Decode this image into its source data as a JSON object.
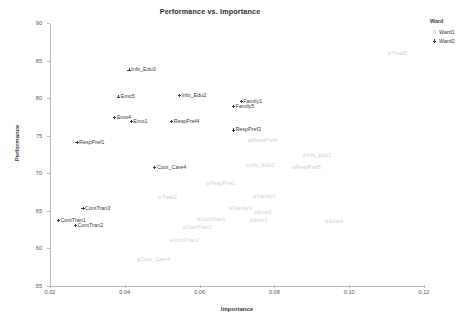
{
  "chart_data": {
    "type": "scatter",
    "title": "Performance vs. Importance",
    "xlabel": "Importance",
    "ylabel": "Performance",
    "xlim": [
      0.02,
      0.12
    ],
    "ylim": [
      55,
      90
    ],
    "xticks": [
      "0.02",
      "0.04",
      "0.06",
      "0.08",
      "0.10",
      "0.12"
    ],
    "xtick_values": [
      0.02,
      0.04,
      0.06,
      0.08,
      0.1,
      0.12
    ],
    "yticks": [
      "90",
      "85",
      "80",
      "75",
      "70",
      "65",
      "60",
      "55"
    ],
    "ytick_values": [
      90,
      85,
      80,
      75,
      70,
      65,
      60,
      55
    ],
    "grid": false,
    "legend": {
      "title": "Ward",
      "position": "right",
      "entries": [
        {
          "label": "Ward1",
          "marker": "circle-marker",
          "color": "#cfcfcf"
        },
        {
          "label": "Ward2",
          "marker": "plus-marker",
          "color": "#3a3a3a"
        }
      ]
    },
    "series": [
      {
        "name": "Ward2",
        "marker": "plus-marker",
        "color": "#3a3a3a",
        "points": [
          {
            "label": "Info_Edu3",
            "x": 0.0411,
            "y": 83.9
          },
          {
            "label": "Emo5",
            "x": 0.0383,
            "y": 80.3
          },
          {
            "label": "Emo4",
            "x": 0.0373,
            "y": 77.6
          },
          {
            "label": "Emo1",
            "x": 0.0417,
            "y": 77.0
          },
          {
            "label": "Info_Edu2",
            "x": 0.0546,
            "y": 80.5
          },
          {
            "label": "Family1",
            "x": 0.0711,
            "y": 79.7
          },
          {
            "label": "Family5",
            "x": 0.069,
            "y": 79.0
          },
          {
            "label": "RespPref4",
            "x": 0.0525,
            "y": 77.0
          },
          {
            "label": "RespPref3",
            "x": 0.069,
            "y": 75.9
          },
          {
            "label": "RespPref1",
            "x": 0.0272,
            "y": 74.2
          },
          {
            "label": "Coor_Care4",
            "x": 0.048,
            "y": 70.9
          },
          {
            "label": "ContTran3",
            "x": 0.0288,
            "y": 65.5
          },
          {
            "label": "ContTran1",
            "x": 0.0222,
            "y": 63.9
          },
          {
            "label": "ContTran2",
            "x": 0.0268,
            "y": 63.2
          }
        ]
      },
      {
        "name": "Ward1",
        "marker": "circle-marker",
        "color": "#cfcfcf",
        "points": [
          {
            "label": "Treat5",
            "x": 0.1108,
            "y": 86.1
          },
          {
            "label": "RespPref4",
            "x": 0.0735,
            "y": 74.5
          },
          {
            "label": "Info_Edu3",
            "x": 0.088,
            "y": 72.5
          },
          {
            "label": "Info_Edu2",
            "x": 0.0728,
            "y": 71.2
          },
          {
            "label": "RespPref5",
            "x": 0.085,
            "y": 70.9
          },
          {
            "label": "RespPref1",
            "x": 0.0622,
            "y": 68.7
          },
          {
            "label": "Treat3",
            "x": 0.0492,
            "y": 66.9
          },
          {
            "label": "Family1",
            "x": 0.0747,
            "y": 67.0
          },
          {
            "label": "Family3",
            "x": 0.0683,
            "y": 65.4
          },
          {
            "label": "Emo5",
            "x": 0.0749,
            "y": 64.9
          },
          {
            "label": "Emo1",
            "x": 0.0738,
            "y": 63.8
          },
          {
            "label": "ContTran1",
            "x": 0.0596,
            "y": 64.0
          },
          {
            "label": "ContTran3",
            "x": 0.0559,
            "y": 62.9
          },
          {
            "label": "ContTran2",
            "x": 0.0525,
            "y": 61.2
          },
          {
            "label": "Emo4",
            "x": 0.094,
            "y": 63.7
          },
          {
            "label": "Coor_Care4",
            "x": 0.0437,
            "y": 58.6
          }
        ]
      }
    ]
  }
}
